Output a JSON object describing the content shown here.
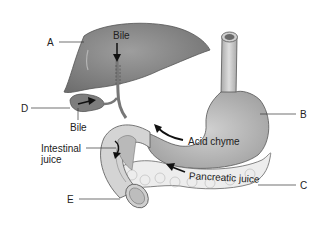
{
  "diagram": {
    "labels": {
      "A": "A",
      "B": "B",
      "C": "C",
      "D": "D",
      "E": "E"
    },
    "annotations": {
      "bile_top": "Bile",
      "bile_bottom": "Bile",
      "acid_chyme": "Acid chyme",
      "intestinal_juice_line1": "Intestinal",
      "intestinal_juice_line2": "juice",
      "pancreatic_juice": "Pancreatic juice"
    },
    "colors": {
      "liver": "#8a8a8a",
      "stomach": "#bdbdbd",
      "pancreas": "#ececec",
      "duodenum": "#d6d6d6",
      "outline": "#555555",
      "arrow": "#111111"
    }
  }
}
